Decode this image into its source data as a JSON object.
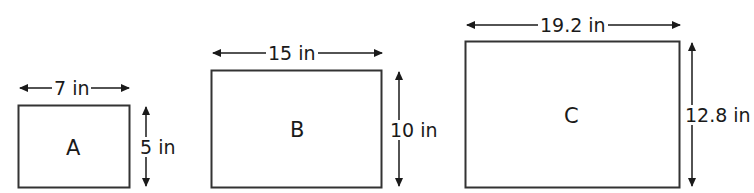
{
  "diagram": {
    "rectangles": [
      {
        "id": "A",
        "label": "A",
        "width_label": "7 in",
        "height_label": "5 in",
        "width_in": 7,
        "height_in": 5
      },
      {
        "id": "B",
        "label": "B",
        "width_label": "15 in",
        "height_label": "10 in",
        "width_in": 15,
        "height_in": 10
      },
      {
        "id": "C",
        "label": "C",
        "width_label": "19.2 in",
        "height_label": "12.8 in",
        "width_in": 19.2,
        "height_in": 12.8
      }
    ]
  }
}
